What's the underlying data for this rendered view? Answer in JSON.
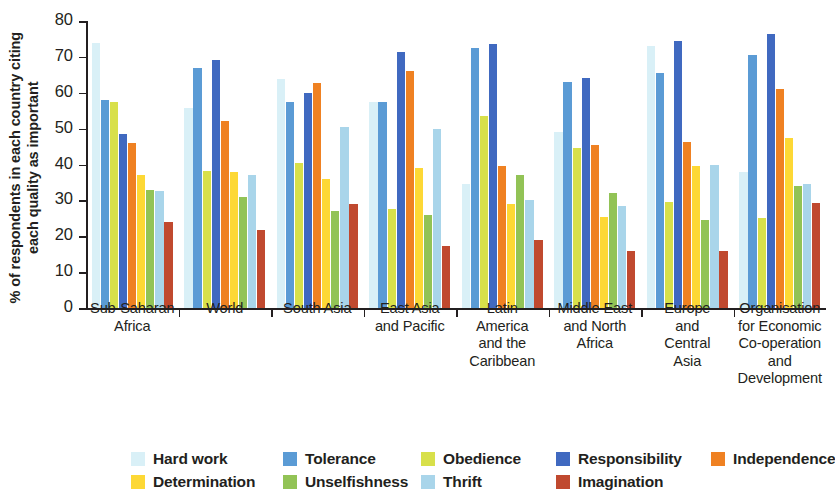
{
  "chart_data": {
    "type": "bar",
    "title": "",
    "xlabel": "",
    "ylabel": "% of respondents in each country citing each quality as important",
    "ylim": [
      0,
      80
    ],
    "yticks": [
      0,
      10,
      20,
      30,
      40,
      50,
      60,
      70,
      80
    ],
    "grid": false,
    "legend_position": "bottom",
    "categories": [
      "Sub-Saharan\nAfrica",
      "World",
      "South Asia",
      "East Asia\nand Pacific",
      "Latin\nAmerica\nand the\nCaribbean",
      "Middle East\nand North\nAfrica",
      "Europe\nand\nCentral\nAsia",
      "Organisation\nfor Economic\nCo-operation\nand\nDevelopment"
    ],
    "series": [
      {
        "name": "Hard work",
        "color": "#d9f0f7",
        "values": [
          74.0,
          55.8,
          63.8,
          57.5,
          34.5,
          49.0,
          73.0,
          38.0
        ]
      },
      {
        "name": "Tolerance",
        "color": "#5b9bd5",
        "values": [
          58.0,
          66.8,
          57.5,
          57.5,
          72.5,
          63.0,
          65.5,
          70.5
        ]
      },
      {
        "name": "Obedience",
        "color": "#d8e04a",
        "values": [
          57.5,
          38.2,
          40.5,
          27.5,
          53.5,
          44.5,
          29.5,
          25.0
        ]
      },
      {
        "name": "Responsibility",
        "color": "#4069c0",
        "values": [
          48.5,
          69.2,
          60.0,
          71.5,
          73.5,
          64.2,
          74.5,
          76.5
        ]
      },
      {
        "name": "Independence",
        "color": "#ef8122",
        "values": [
          46.0,
          52.0,
          62.8,
          66.0,
          39.5,
          45.5,
          46.2,
          61.0
        ]
      },
      {
        "name": "Determination",
        "color": "#fdd835",
        "values": [
          37.0,
          38.0,
          36.0,
          39.0,
          29.0,
          25.5,
          39.5,
          47.5
        ]
      },
      {
        "name": "Unselfishness",
        "color": "#92c356",
        "values": [
          33.0,
          31.0,
          27.0,
          26.0,
          37.2,
          32.0,
          24.5,
          34.0
        ]
      },
      {
        "name": "Thrift",
        "color": "#a9d5ea",
        "values": [
          32.5,
          37.0,
          50.5,
          50.0,
          30.0,
          28.5,
          40.0,
          34.5
        ]
      },
      {
        "name": "Imagination",
        "color": "#c0492f",
        "values": [
          24.0,
          21.8,
          29.0,
          17.2,
          19.0,
          16.0,
          16.0,
          29.2
        ]
      }
    ]
  }
}
